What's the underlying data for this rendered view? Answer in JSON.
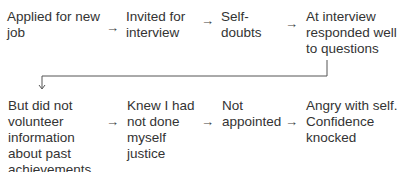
{
  "diagram": {
    "row1": [
      {
        "lines": [
          "Applied for new",
          "job"
        ]
      },
      {
        "lines": [
          "Invited for",
          "interview"
        ]
      },
      {
        "lines": [
          "Self-",
          "doubts"
        ]
      },
      {
        "lines": [
          "At interview",
          "responded well",
          "to questions"
        ]
      }
    ],
    "row2": [
      {
        "lines": [
          "But did not",
          "volunteer",
          "information",
          "about past",
          "achievements"
        ]
      },
      {
        "lines": [
          "Knew I had",
          "not done",
          "myself",
          "justice"
        ]
      },
      {
        "lines": [
          "Not",
          "appointed"
        ]
      },
      {
        "lines": [
          "Angry with self.",
          "Confidence",
          "knocked"
        ]
      }
    ],
    "arrow_glyph": "→",
    "down_arrow_glyph": "↓"
  }
}
